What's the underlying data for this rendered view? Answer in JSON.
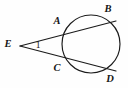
{
  "figure": {
    "background_color": "#fefefe",
    "stroke_color": "#1a1a1a",
    "width": 128,
    "height": 88,
    "circle": {
      "name": "circle",
      "cx": 91,
      "cy": 44,
      "r": 29
    },
    "points": [
      {
        "id": "E",
        "label": "E",
        "x": 20,
        "y": 46,
        "label_x": 8,
        "label_y": 45,
        "role": "external-vertex"
      },
      {
        "id": "A",
        "label": "A",
        "x": 67,
        "y": 31,
        "label_x": 57,
        "label_y": 22,
        "role": "near-intersection-upper"
      },
      {
        "id": "B",
        "label": "B",
        "x": 113,
        "y": 22,
        "label_x": 108,
        "label_y": 10,
        "role": "far-intersection-upper"
      },
      {
        "id": "C",
        "label": "C",
        "x": 67,
        "y": 60,
        "label_x": 57,
        "label_y": 69,
        "role": "near-intersection-lower"
      },
      {
        "id": "D",
        "label": "D",
        "x": 113,
        "y": 70,
        "label_x": 110,
        "label_y": 80,
        "role": "far-intersection-lower"
      }
    ],
    "segments": [
      {
        "name": "secant-e-b",
        "from": "E",
        "to": "B",
        "x1": 20,
        "y1": 46,
        "x2": 116,
        "y2": 21
      },
      {
        "name": "secant-e-d",
        "from": "E",
        "to": "D",
        "x1": 20,
        "y1": 46,
        "x2": 116,
        "y2": 71
      }
    ],
    "angle": {
      "name": "angle-1",
      "label": "1",
      "vertex": "E",
      "x": 38,
      "y": 46
    }
  }
}
